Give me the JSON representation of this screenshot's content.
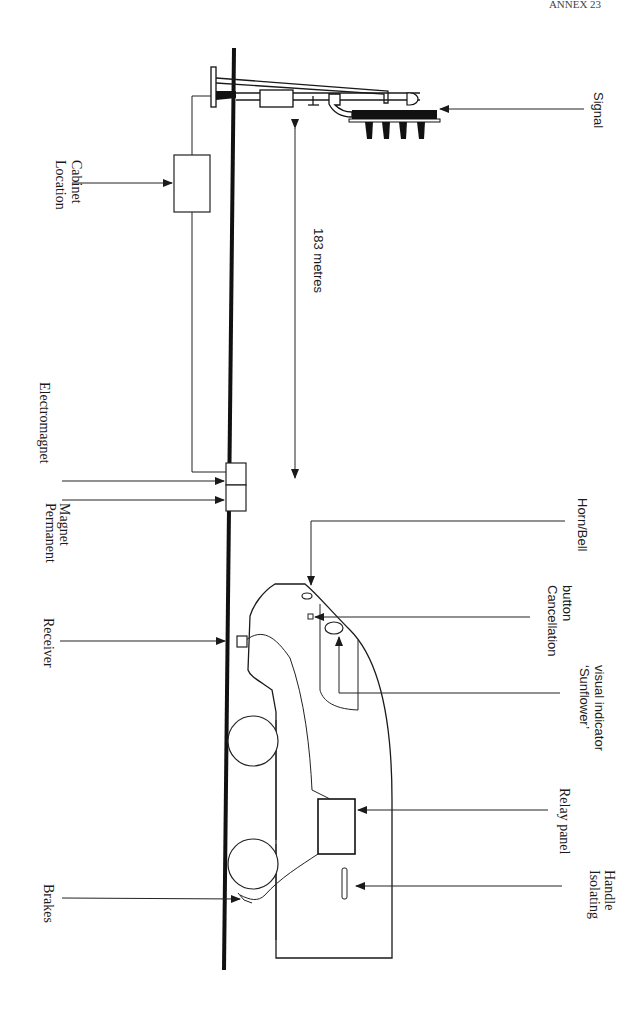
{
  "page": {
    "header_fragment": "ANNEX 23"
  },
  "diagram": {
    "colors": {
      "ink": "#1a1a1a",
      "background": "#ffffff"
    },
    "labels": {
      "signal": "Signal",
      "location_cabinet_1": "Location",
      "location_cabinet_2": "Cabinet",
      "distance": "183 metres",
      "electromagnet": "Electromagnet",
      "permanent_magnet_1": "Permanent",
      "permanent_magnet_2": "Magnet",
      "receiver": "Receiver",
      "horn_bell": "Horn/Bell",
      "cancellation_button_1": "Cancellation",
      "cancellation_button_2": "button",
      "sunflower_1": "‘Sunflower’",
      "sunflower_2": "visual indicator",
      "relay_panel": "Relay panel",
      "isolating_handle_1": "Isolating",
      "isolating_handle_2": "Handle",
      "brakes": "Brakes"
    }
  }
}
